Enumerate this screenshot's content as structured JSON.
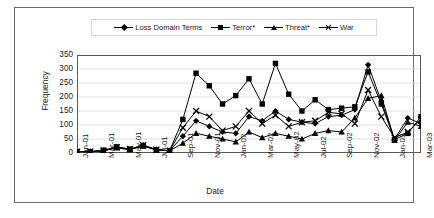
{
  "chart_data": {
    "type": "line",
    "title": "",
    "xlabel": "Date",
    "ylabel": "Frequency",
    "ylim": [
      0,
      350
    ],
    "yticks": [
      0,
      50,
      100,
      150,
      200,
      250,
      300,
      350
    ],
    "grid": true,
    "legend_position": "top",
    "x": [
      "Jan-01",
      "Feb-01",
      "Mar-01",
      "Apr-01",
      "May-01",
      "Jun-01",
      "Jul-01",
      "Aug-01",
      "Sep-01",
      "Oct-01",
      "Nov-01",
      "Dec-01",
      "Jan-02",
      "Feb-02",
      "Mar-02",
      "Apr-02",
      "May-02",
      "Jun-02",
      "Jul-02",
      "Aug-02",
      "Sep-02",
      "Oct-02",
      "Nov-02",
      "Dec-02",
      "Jan-03",
      "Feb-03",
      "Mar-03"
    ],
    "xtick_labels": [
      "Jan-01",
      "Mar-01",
      "May-01",
      "Jul-01",
      "Sep-01",
      "Nov-01",
      "Jan-02",
      "Mar-02",
      "May-02",
      "Jul-02",
      "Sep-02",
      "Nov-02",
      "Jan-03",
      "Mar-03"
    ],
    "xtick_indices": [
      0,
      2,
      4,
      6,
      8,
      10,
      12,
      14,
      16,
      18,
      20,
      22,
      24,
      26
    ],
    "series": [
      {
        "name": "Loss Domain Terms",
        "marker": "diamond",
        "values": [
          5,
          5,
          8,
          20,
          12,
          28,
          12,
          8,
          60,
          115,
          95,
          75,
          70,
          130,
          115,
          150,
          120,
          110,
          105,
          130,
          135,
          155,
          315,
          185,
          50,
          125,
          105
        ]
      },
      {
        "name": "Terror*",
        "marker": "square",
        "values": [
          5,
          5,
          10,
          22,
          14,
          25,
          12,
          8,
          120,
          285,
          240,
          175,
          205,
          265,
          175,
          320,
          210,
          150,
          190,
          155,
          160,
          165,
          290,
          175,
          48,
          70,
          130
        ]
      },
      {
        "name": "Threat*",
        "marker": "triangle",
        "values": [
          5,
          5,
          8,
          18,
          12,
          25,
          10,
          8,
          35,
          70,
          60,
          50,
          40,
          75,
          55,
          70,
          60,
          50,
          70,
          80,
          75,
          125,
          195,
          205,
          45,
          110,
          95
        ]
      },
      {
        "name": "War",
        "marker": "x",
        "values": [
          5,
          5,
          8,
          20,
          14,
          28,
          12,
          8,
          90,
          150,
          130,
          80,
          95,
          150,
          105,
          135,
          95,
          110,
          115,
          145,
          140,
          105,
          225,
          130,
          55,
          75,
          120
        ]
      }
    ]
  },
  "legend": {
    "items": [
      {
        "label": "Loss Domain Terms",
        "marker": "diamond"
      },
      {
        "label": "Terror*",
        "marker": "square"
      },
      {
        "label": "Threat*",
        "marker": "triangle"
      },
      {
        "label": "War",
        "marker": "x"
      }
    ]
  },
  "colors": {
    "series": "#000000",
    "grid": "#d9d9d9",
    "axis": "#595959",
    "frame": "#6b6b6b",
    "background": "#ffffff"
  }
}
